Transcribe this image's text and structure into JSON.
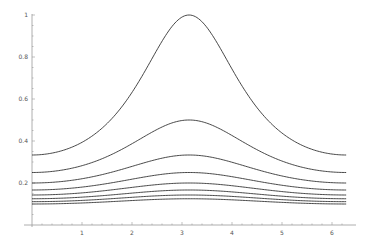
{
  "chart_data": {
    "type": "line",
    "title": "",
    "xlabel": "",
    "ylabel": "",
    "xlim": [
      0,
      6.2832
    ],
    "ylim": [
      0,
      1
    ],
    "grid": false,
    "legend": null,
    "x_ticks": [
      1,
      2,
      3,
      4,
      5,
      6
    ],
    "x_tick_labels": [
      "1",
      "2",
      "3",
      "4",
      "5",
      "6"
    ],
    "y_ticks": [
      0.2,
      0.4,
      0.6,
      0.8,
      1
    ],
    "y_tick_labels": [
      "0.2",
      "0.4",
      "0.6",
      "0.8",
      "1"
    ],
    "formula": "f_n(x) = 1 / (n + 1 + cos x), n = 1..8",
    "series": [
      {
        "name": "n=1",
        "x": [
          0,
          1.5708,
          3.1416,
          4.7124,
          6.2832
        ],
        "values": [
          0.333,
          0.5,
          1.0,
          0.5,
          0.333
        ]
      },
      {
        "name": "n=2",
        "x": [
          0,
          1.5708,
          3.1416,
          4.7124,
          6.2832
        ],
        "values": [
          0.25,
          0.333,
          0.5,
          0.333,
          0.25
        ]
      },
      {
        "name": "n=3",
        "x": [
          0,
          1.5708,
          3.1416,
          4.7124,
          6.2832
        ],
        "values": [
          0.2,
          0.25,
          0.333,
          0.25,
          0.2
        ]
      },
      {
        "name": "n=4",
        "x": [
          0,
          1.5708,
          3.1416,
          4.7124,
          6.2832
        ],
        "values": [
          0.167,
          0.2,
          0.25,
          0.2,
          0.167
        ]
      },
      {
        "name": "n=5",
        "x": [
          0,
          1.5708,
          3.1416,
          4.7124,
          6.2832
        ],
        "values": [
          0.143,
          0.167,
          0.2,
          0.167,
          0.143
        ]
      },
      {
        "name": "n=6",
        "x": [
          0,
          1.5708,
          3.1416,
          4.7124,
          6.2832
        ],
        "values": [
          0.125,
          0.143,
          0.167,
          0.143,
          0.125
        ]
      },
      {
        "name": "n=7",
        "x": [
          0,
          1.5708,
          3.1416,
          4.7124,
          6.2832
        ],
        "values": [
          0.111,
          0.125,
          0.143,
          0.125,
          0.111
        ]
      },
      {
        "name": "n=8",
        "x": [
          0,
          1.5708,
          3.1416,
          4.7124,
          6.2832
        ],
        "values": [
          0.1,
          0.111,
          0.125,
          0.111,
          0.1
        ]
      }
    ],
    "line_color": "#333333",
    "axis_color": "#999999"
  }
}
